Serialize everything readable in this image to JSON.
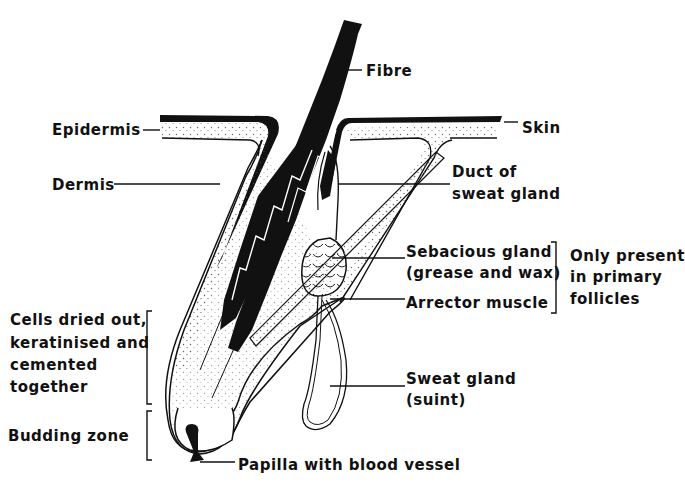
{
  "colors": {
    "ink": "#111111",
    "background": "#ffffff",
    "stipple": "#555555"
  },
  "labels": {
    "fibre": "Fibre",
    "epidermis": "Epidermis",
    "skin": "Skin",
    "dermis": "Dermis",
    "duct_line1": "Duct of",
    "duct_line2": "sweat gland",
    "sebaceous_line1": "Sebacious gland",
    "sebaceous_line2": "(grease and wax)",
    "primary_line1": "Only present",
    "primary_line2": "in primary",
    "primary_line3": "follicles",
    "arrector": "Arrector muscle",
    "cells_line1": "Cells dried out,",
    "cells_line2": "keratinised and",
    "cells_line3": "cemented",
    "cells_line4": "together",
    "sweat_line1": "Sweat gland",
    "sweat_line2": "(suint)",
    "budding": "Budding zone",
    "papilla": "Papilla with blood vessel"
  }
}
